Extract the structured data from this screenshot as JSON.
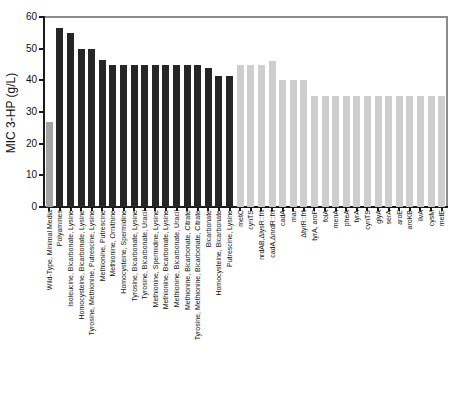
{
  "chart_data": {
    "type": "bar",
    "title": "",
    "xlabel": "",
    "ylabel": "MIC 3-HP (g/L)",
    "ylim": [
      0,
      60
    ],
    "yticks": [
      0,
      10,
      20,
      30,
      40,
      50,
      60
    ],
    "grid": false,
    "legend": "none",
    "categories": [
      "Wild-Type, Minimal Media",
      "Polyamines",
      "Isoleucine, Bicarbonate, Lysine",
      "Homocysteine, Bicarbonate, Lysine",
      "Tyrosine, Methionine, Putrescine, Lysine",
      "Methionine, Putrescine",
      "Methionine, Ornithine",
      "Homocysteine, Spermidine",
      "Tyrosine, Bicarbonate, Lysine",
      "Tyrosine, Bicarbonate, Uracil",
      "Methionine, Spermidine, Lysine",
      "Methionine, Bicarbonate, Lysine",
      "Methionine, Bicarbonate, Uracil",
      "Methionine, Bicarbonate, Citrate",
      "Tyrosine, Methionine, Bicarbonate, Citrate",
      "Bicarbonate",
      "Homocysteine, Bicarbonate",
      "Putrescine, Lysine",
      "metC",
      "cynTS",
      "nrdAB,ΔlysR::frt",
      "cadA,ΔnrdR::frt",
      "cadA",
      "mar",
      "ΔtyrR::frt",
      "tyrA, aroF",
      "folA",
      "menA",
      "pheA",
      "tyrA",
      "cynTS",
      "glyA",
      "serA",
      "aroE",
      "aroKB",
      "ilvA",
      "cysM",
      "metE"
    ],
    "values": [
      27,
      56.5,
      55,
      50,
      50,
      46.5,
      45,
      45,
      45,
      45,
      45,
      45,
      45,
      45,
      45,
      44,
      41.5,
      41.5,
      45,
      45,
      45,
      46,
      40,
      40,
      40,
      35,
      35,
      35,
      35,
      35,
      35,
      35,
      35,
      35,
      35,
      35,
      35,
      35
    ],
    "bar_groups": [
      "wild_type",
      "media_supplement",
      "media_supplement",
      "media_supplement",
      "media_supplement",
      "media_supplement",
      "media_supplement",
      "media_supplement",
      "media_supplement",
      "media_supplement",
      "media_supplement",
      "media_supplement",
      "media_supplement",
      "media_supplement",
      "media_supplement",
      "media_supplement",
      "media_supplement",
      "media_supplement",
      "genetic_element",
      "genetic_element",
      "genetic_element",
      "genetic_element",
      "genetic_element",
      "genetic_element",
      "genetic_element",
      "genetic_element",
      "genetic_element",
      "genetic_element",
      "genetic_element",
      "genetic_element",
      "genetic_element",
      "genetic_element",
      "genetic_element",
      "genetic_element",
      "genetic_element",
      "genetic_element",
      "genetic_element",
      "genetic_element"
    ],
    "group_colors": {
      "wild_type": "#a3a3a3",
      "media_supplement": "#262626",
      "genetic_element": "#cecece"
    }
  }
}
